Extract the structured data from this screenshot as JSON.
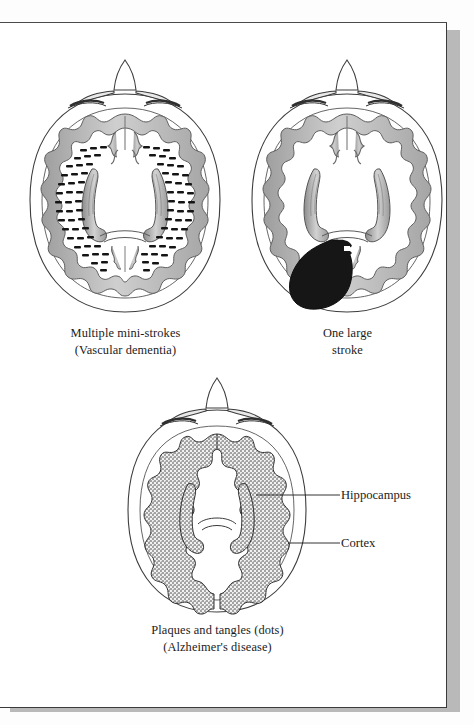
{
  "page": {
    "background_color": "#ffffff",
    "border_color": "#3a3a3a",
    "shadow_color": "#b9b9b9"
  },
  "palette": {
    "ink": "#1b1b1b",
    "outline": "#2a2a2a",
    "cortex_gray": "#b3b3b3",
    "cortex_gray_dark": "#8f8f8f",
    "ventricle_gray": "#c2c2c2",
    "lesion_black": "#161616",
    "skull_line": "#3c3c3c"
  },
  "figures": [
    {
      "id": "vascular-dementia",
      "name": "brain-multiple-mini-strokes",
      "view": "axial cross-section of head, viewed from above",
      "cortex_style": "smooth-gray-ribbon",
      "pathology": "many small dark dashes (infarcts) scattered through white matter in two arcs",
      "caption_line1": "Multiple mini-strokes",
      "caption_line2": "(Vascular dementia)"
    },
    {
      "id": "large-stroke",
      "name": "brain-one-large-stroke",
      "view": "axial cross-section of head, viewed from above",
      "cortex_style": "smooth-gray-ribbon",
      "pathology": "one large solid black irregular infarct in the posterior left hemisphere",
      "caption_line1": "One large",
      "caption_line2": "stroke"
    },
    {
      "id": "alzheimers",
      "name": "brain-plaques-and-tangles",
      "view": "axial cross-section of head, viewed from above",
      "cortex_style": "stippled-dotted-ribbon",
      "pathology": "shrunken atrophic cortex stippled with dots representing plaques and tangles",
      "caption_line1": "Plaques and tangles (dots)",
      "caption_line2": "(Alzheimer's disease)"
    }
  ],
  "labels": [
    {
      "id": "hippocampus",
      "text": "Hippocampus"
    },
    {
      "id": "cortex",
      "text": "Cortex"
    }
  ]
}
